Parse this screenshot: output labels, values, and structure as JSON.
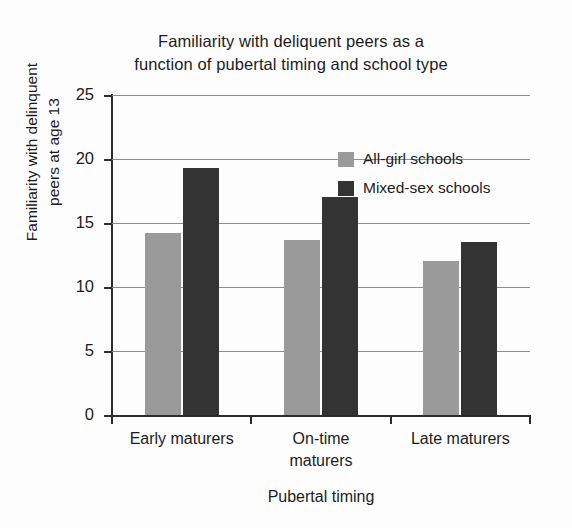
{
  "chart_data": {
    "type": "bar",
    "title": "Familiarity with deliquent peers as a\nfunction of pubertal timing and school type",
    "xlabel": "Pubertal timing",
    "ylabel": "Familiarity with delinquent\npeers at age 13",
    "categories": [
      "Early maturers",
      "On-time\nmaturers",
      "Late maturers"
    ],
    "series": [
      {
        "name": "All-girl schools",
        "color": "#9a9a9a",
        "values": [
          14.2,
          13.7,
          12.0
        ]
      },
      {
        "name": "Mixed-sex schools",
        "color": "#333333",
        "values": [
          19.3,
          17.0,
          13.5
        ]
      }
    ],
    "ylim": [
      0,
      25
    ],
    "yticks": [
      0,
      5,
      10,
      15,
      20,
      25
    ],
    "ytick_labels": [
      "0",
      "5",
      "10",
      "15",
      "20",
      "25"
    ],
    "grid": true,
    "legend_position": "upper-right-inside"
  },
  "figure": {
    "background_color": "#fdfdfd",
    "axis_color": "#2b2b2b",
    "grid_color": "#8d8d8d"
  }
}
